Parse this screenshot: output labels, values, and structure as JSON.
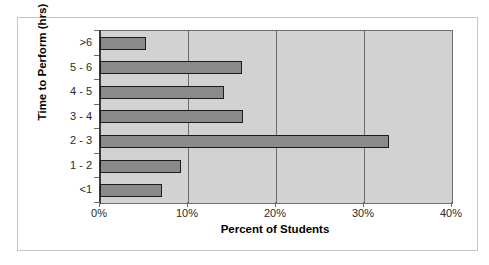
{
  "figure": {
    "top_artifact_text": "·     ·    ··     ·",
    "frame_border_color": "#c6c6c6",
    "plot_background_color": "#d2d2d2",
    "bar_fill_color": "#8a8a8a",
    "bar_border_color": "#1c1c1c",
    "gridline_color": "#6d6d6d"
  },
  "chart_data": {
    "type": "bar",
    "orientation": "horizontal",
    "title": "",
    "xlabel": "Percent of Students",
    "ylabel": "Time to Perform (hrs)",
    "categories": [
      "<1",
      "1 - 2",
      "2 - 3",
      "3 - 4",
      "4 - 5",
      "5 - 6",
      ">6"
    ],
    "values": [
      7.0,
      9.1,
      32.6,
      16.2,
      14.0,
      16.1,
      5.2
    ],
    "value_unit": "percent",
    "xlim": [
      0,
      40
    ],
    "xticks": [
      0,
      10,
      20,
      30,
      40
    ],
    "xticklabels": [
      "0%",
      "10%",
      "20%",
      "30%",
      "40%"
    ],
    "grid": "vertical",
    "legend": "none"
  }
}
